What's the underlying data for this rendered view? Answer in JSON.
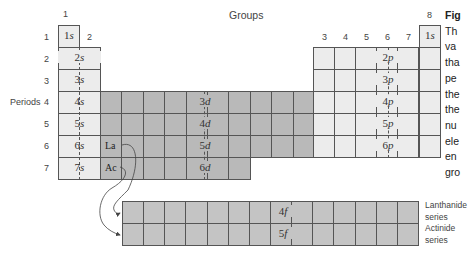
{
  "header": {
    "groups_label": "Groups",
    "group_numbers": [
      "1",
      "2",
      "3",
      "4",
      "5",
      "6",
      "7",
      "8"
    ]
  },
  "periods": {
    "label": "Periods",
    "numbers": [
      "1",
      "2",
      "3",
      "4",
      "5",
      "6",
      "7"
    ]
  },
  "s_block": [
    "1s",
    "2s",
    "3s",
    "4s",
    "5s",
    "6s",
    "7s"
  ],
  "he_cell": "1s",
  "p_block": [
    "2p",
    "3p",
    "4p",
    "5p",
    "6p"
  ],
  "d_block": [
    "3d",
    "4d",
    "5d",
    "6d"
  ],
  "f_block": [
    "4f",
    "5f"
  ],
  "elements": {
    "la": "La",
    "ac": "Ac"
  },
  "series_labels": {
    "lanthanide_line1": "Lanthanide",
    "lanthanide_line2": "series",
    "actinide_line1": "Actinide",
    "actinide_line2": "series"
  },
  "caption": {
    "title_fragment": "Fig",
    "lines": [
      "Th",
      "va",
      "tha",
      "pe",
      "the",
      "the",
      "nu",
      "ele",
      "en",
      "gro"
    ]
  },
  "colors": {
    "s_p_block": "#ececec",
    "d_block": "#b9b9b9",
    "f_block": "#c4c4c4",
    "border": "#555555"
  }
}
